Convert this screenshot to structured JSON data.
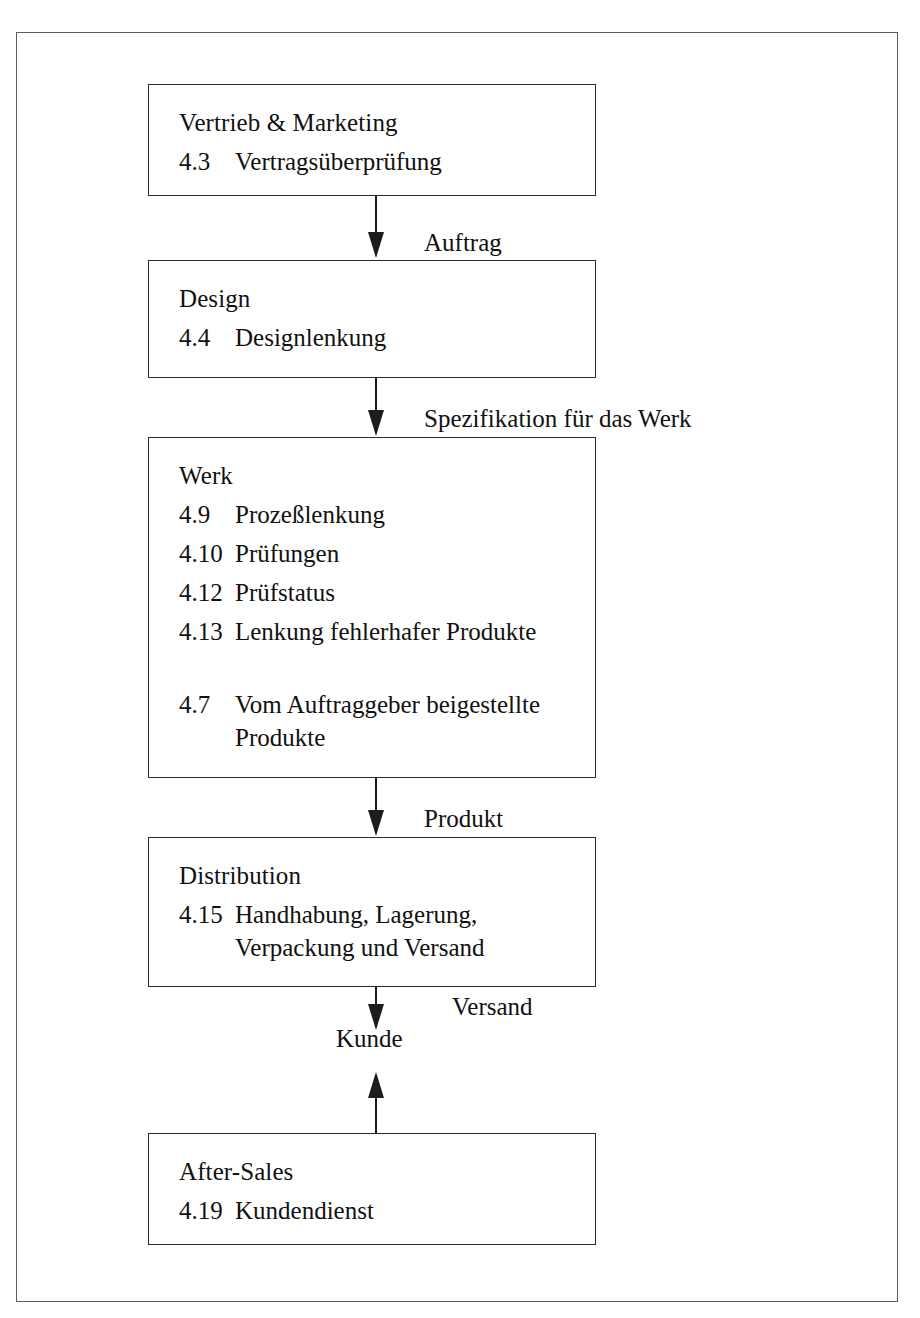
{
  "diagram": {
    "type": "flowchart",
    "orientation": "vertical",
    "nodes": [
      {
        "id": "vertrieb",
        "title": "Vertrieb & Marketing",
        "clauses": [
          {
            "num": "4.3",
            "text": "Vertragsüberprüfung"
          }
        ]
      },
      {
        "id": "design",
        "title": "Design",
        "clauses": [
          {
            "num": "4.4",
            "text": "Designlenkung"
          }
        ]
      },
      {
        "id": "werk",
        "title": "Werk",
        "clauses": [
          {
            "num": "4.9",
            "text": "Prozeßlenkung"
          },
          {
            "num": "4.10",
            "text": "Prüfungen"
          },
          {
            "num": "4.12",
            "text": "Prüfstatus"
          },
          {
            "num": "4.13",
            "text": "Lenkung fehlerhafer Produkte"
          },
          {
            "num": "4.7",
            "text": "Vom Auftraggeber beigestellte\nProdukte"
          }
        ]
      },
      {
        "id": "distribution",
        "title": "Distribution",
        "clauses": [
          {
            "num": "4.15",
            "text": "Handhabung, Lagerung,\nVerpackung und Versand"
          }
        ]
      },
      {
        "id": "aftersales",
        "title": "After-Sales",
        "clauses": [
          {
            "num": "4.19",
            "text": "Kundendienst"
          }
        ]
      }
    ],
    "edge_labels": {
      "auftrag": "Auftrag",
      "spezifikation": "Spezifikation für das Werk",
      "produkt": "Produkt",
      "versand": "Versand",
      "kunde": "Kunde"
    },
    "colors": {
      "box_border": "#2b2b2b",
      "box_shadow": "#1c1c1c",
      "frame_border": "#5d5d5d",
      "arrow": "#1c1c1c",
      "text": "#111111",
      "background": "#ffffff"
    }
  }
}
